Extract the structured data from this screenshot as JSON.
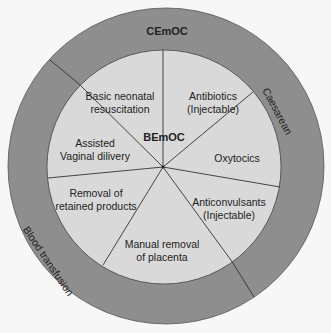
{
  "diagram": {
    "outer_ring": {
      "title": "CEmOC",
      "labels": [
        "Caesarean",
        "Blood transfusion"
      ]
    },
    "inner_circle": {
      "title": "BEmOC",
      "segments": [
        {
          "line1": "Basic neonatal",
          "line2": "resuscitation"
        },
        {
          "line1": "Antibiotics",
          "line2": "(Injectable)"
        },
        {
          "line1": "Oxytocics",
          "line2": ""
        },
        {
          "line1": "Anticonvulsants",
          "line2": "(Injectable)"
        },
        {
          "line1": "Manual removal",
          "line2": "of placenta"
        },
        {
          "line1": "Removal of",
          "line2": "retained products"
        },
        {
          "line1": "Assisted",
          "line2": "Vaginal dilivery"
        }
      ]
    },
    "colors": {
      "outer_ring": "#8e8e8e",
      "inner_circle": "#d9d9d9",
      "background": "#f7f7f7",
      "lines": "#333333"
    }
  }
}
